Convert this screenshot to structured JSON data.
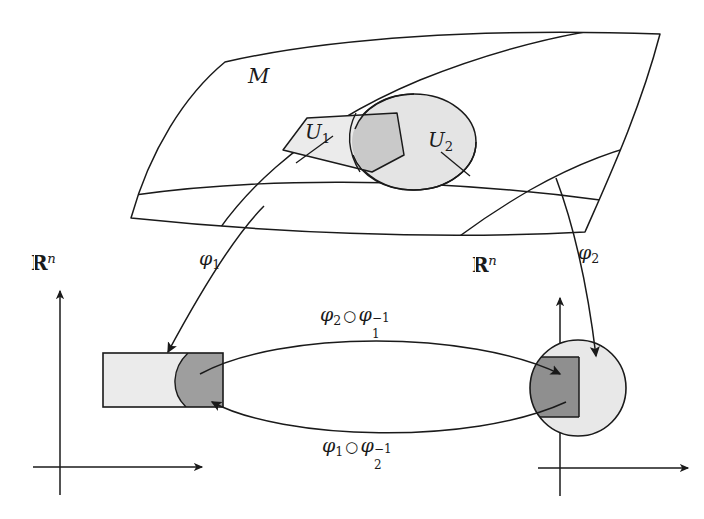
{
  "figure": {
    "type": "manifold-chart-diagram",
    "manifold_label": "M",
    "charts": [
      {
        "name": "U1",
        "label_base": "U",
        "label_sub": "1",
        "shape": "quadrilateral",
        "fill": "#ebebeb"
      },
      {
        "name": "U2",
        "label_base": "U",
        "label_sub": "2",
        "shape": "ellipse",
        "fill": "#e4e4e4"
      }
    ],
    "overlap_fill": "#c9c9c9",
    "chart_maps": [
      {
        "name": "phi1",
        "symbol": "φ",
        "sub": "1",
        "from": "U1",
        "to": "Rn-left"
      },
      {
        "name": "phi2",
        "symbol": "φ",
        "sub": "2",
        "from": "U2",
        "to": "Rn-right"
      }
    ],
    "euclidean_spaces": [
      {
        "name": "Rn-left",
        "label_R": "R",
        "label_sup": "n"
      },
      {
        "name": "Rn-right",
        "label_R": "R",
        "label_sup": "n"
      }
    ],
    "transition_maps": [
      {
        "name": "phi2-after-phi1-inverse",
        "first": "φ",
        "first_sub": "2",
        "op": "○",
        "second": "φ",
        "second_sub": "1",
        "second_sup": "−1",
        "direction": "left-to-right"
      },
      {
        "name": "phi1-after-phi2-inverse",
        "first": "φ",
        "first_sub": "1",
        "op": "○",
        "second": "φ",
        "second_sub": "2",
        "second_sup": "−1",
        "direction": "right-to-left"
      }
    ],
    "image_regions": {
      "left_rectangle": {
        "light_fill": "#ebebeb",
        "dark_fill": "#9e9e9e"
      },
      "right_circle": {
        "light_fill": "#e8e8e8",
        "dark_fill": "#8f8f8f"
      }
    },
    "colors": {
      "stroke": "#1a1a1a",
      "axis": "#1a1a1a",
      "background": "#ffffff"
    }
  }
}
